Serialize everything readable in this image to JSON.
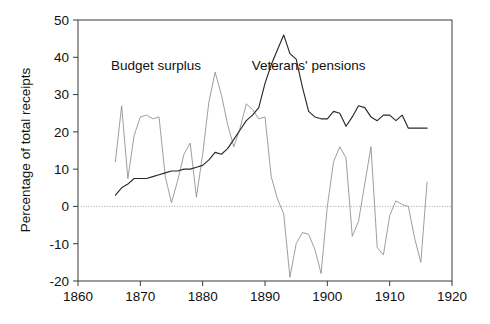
{
  "chart_data": {
    "type": "line",
    "title": "",
    "xlabel": "",
    "ylabel": "Percentage of total receipts",
    "xlim": [
      1860,
      1920
    ],
    "ylim": [
      -20,
      50
    ],
    "xticks": [
      1860,
      1870,
      1880,
      1890,
      1900,
      1910,
      1920
    ],
    "yticks": [
      -20,
      -10,
      0,
      10,
      20,
      30,
      40,
      50
    ],
    "xtick_labels": [
      "1860",
      "1870",
      "1880",
      "1890",
      "1900",
      "1910",
      "1920"
    ],
    "ytick_labels": [
      "-20",
      "-10",
      "0",
      "10",
      "20",
      "30",
      "40",
      "50"
    ],
    "grid": false,
    "zero_line": true,
    "legend": "annotations-in-plot",
    "annotations": [
      {
        "text": "Budget surplus",
        "x": 1872.5,
        "y": 36.5,
        "series": "Budget surplus"
      },
      {
        "text": "Veterans' pensions",
        "x": 1897.0,
        "y": 36.5,
        "series": "Veterans' pensions"
      }
    ],
    "series": [
      {
        "name": "Budget surplus",
        "style": "dotted",
        "color": "#8d8d8d",
        "x": [
          1866,
          1867,
          1868,
          1869,
          1870,
          1871,
          1872,
          1873,
          1874,
          1875,
          1876,
          1877,
          1878,
          1879,
          1880,
          1881,
          1882,
          1883,
          1884,
          1885,
          1886,
          1887,
          1888,
          1889,
          1890,
          1891,
          1892,
          1893,
          1894,
          1895,
          1896,
          1897,
          1898,
          1899,
          1900,
          1901,
          1902,
          1903,
          1904,
          1905,
          1906,
          1907,
          1908,
          1909,
          1910,
          1911,
          1912,
          1913,
          1914,
          1915,
          1916
        ],
        "values": [
          12.0,
          27.0,
          7.5,
          19.0,
          24.0,
          24.5,
          23.5,
          24.0,
          8.0,
          1.0,
          7.0,
          14.0,
          17.0,
          2.5,
          14.0,
          28.0,
          36.0,
          30.0,
          22.0,
          16.0,
          21.0,
          27.5,
          26.0,
          23.5,
          24.0,
          8.0,
          2.0,
          -2.0,
          -19.0,
          -10.0,
          -7.0,
          -7.5,
          -11.5,
          -18.0,
          0.0,
          12.0,
          16.0,
          13.0,
          -8.0,
          -4.0,
          6.0,
          16.0,
          -11.0,
          -13.0,
          -2.5,
          1.5,
          0.5,
          0.0,
          -8.5,
          -15.0,
          6.5
        ]
      },
      {
        "name": "Veterans' pensions",
        "style": "solid",
        "color": "#2a2a2a",
        "x": [
          1866,
          1867,
          1868,
          1869,
          1870,
          1871,
          1872,
          1873,
          1874,
          1875,
          1876,
          1877,
          1878,
          1879,
          1880,
          1881,
          1882,
          1883,
          1884,
          1885,
          1886,
          1887,
          1888,
          1889,
          1890,
          1891,
          1892,
          1893,
          1894,
          1895,
          1896,
          1897,
          1898,
          1899,
          1900,
          1901,
          1902,
          1903,
          1904,
          1905,
          1906,
          1907,
          1908,
          1909,
          1910,
          1911,
          1912,
          1913,
          1914,
          1915,
          1916
        ],
        "values": [
          3.0,
          5.0,
          6.0,
          7.5,
          7.5,
          7.5,
          8.0,
          8.5,
          9.0,
          9.5,
          9.5,
          10.0,
          10.0,
          10.5,
          11.0,
          12.5,
          14.5,
          14.0,
          15.5,
          18.0,
          20.5,
          23.0,
          24.5,
          26.5,
          33.0,
          38.0,
          42.0,
          46.0,
          41.0,
          39.5,
          32.0,
          25.5,
          24.0,
          23.5,
          23.5,
          25.5,
          25.0,
          21.5,
          24.0,
          27.0,
          26.5,
          24.0,
          23.0,
          24.5,
          24.5,
          23.0,
          24.5,
          21.0,
          21.0,
          21.0,
          21.0
        ]
      }
    ]
  },
  "axes": {
    "y_axis_title": "Percentage of total receipts"
  }
}
